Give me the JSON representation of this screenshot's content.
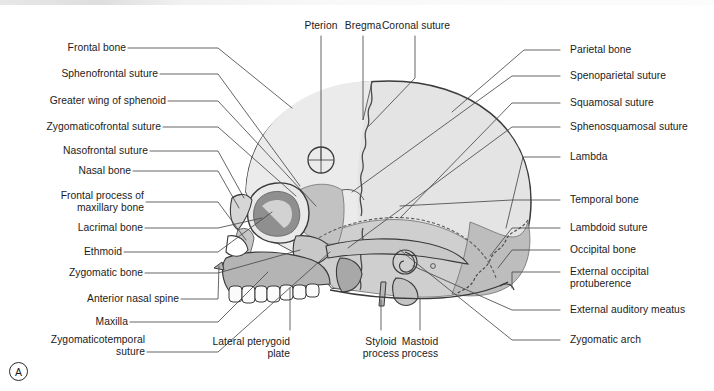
{
  "figure": {
    "panel_letter": "A"
  },
  "colors": {
    "background": "#ffffff",
    "outline": "#3a3a3a",
    "leader_line": "#4a4a4a",
    "text": "#1b1b1b",
    "frontal_bone": "#ebebeb",
    "parietal_bone": "#e4e4e4",
    "temporal_bone": "#cfcfcf",
    "occipital_bone": "#bdbdbd",
    "sphenoid": "#c2c2c2",
    "maxilla": "#b4b4b4",
    "zygomatic_bone": "#c8c8c8",
    "nasal_bone": "#d6d6d6",
    "orbit_shadow": "#8f8f8f",
    "teeth": "#fbfbfb"
  },
  "labels": {
    "top": [
      {
        "id": "pterion",
        "text": "Pterion"
      },
      {
        "id": "bregma",
        "text": "Bregma"
      },
      {
        "id": "coronal-suture",
        "text": "Coronal suture"
      }
    ],
    "left": [
      {
        "id": "frontal-bone",
        "text": "Frontal bone"
      },
      {
        "id": "sphenofrontal-suture",
        "text": "Sphenofrontal suture"
      },
      {
        "id": "greater-wing-of-sphenoid",
        "text": "Greater wing of sphenoid"
      },
      {
        "id": "zygomaticofrontal-suture",
        "text": "Zygomaticofrontal suture"
      },
      {
        "id": "nasofrontal-suture",
        "text": "Nasofrontal suture"
      },
      {
        "id": "nasal-bone",
        "text": "Nasal bone"
      },
      {
        "id": "frontal-process-of-maxillary-bone",
        "text": "Frontal process of\nmaxillary bone"
      },
      {
        "id": "lacrimal-bone",
        "text": "Lacrimal bone"
      },
      {
        "id": "ethmoid",
        "text": "Ethmoid"
      },
      {
        "id": "zygomatic-bone",
        "text": "Zygomatic bone"
      },
      {
        "id": "anterior-nasal-spine",
        "text": "Anterior nasal spine"
      },
      {
        "id": "maxilla",
        "text": "Maxilla"
      },
      {
        "id": "zygomaticotemporal-suture",
        "text": "Zygomaticotemporal\nsuture"
      }
    ],
    "right": [
      {
        "id": "parietal-bone",
        "text": "Parietal bone"
      },
      {
        "id": "spenoparietal-suture",
        "text": "Spenoparietal suture"
      },
      {
        "id": "squamosal-suture",
        "text": "Squamosal suture"
      },
      {
        "id": "sphenosquamosal-suture",
        "text": "Sphenosquamosal suture"
      },
      {
        "id": "lambda",
        "text": "Lambda"
      },
      {
        "id": "temporal-bone",
        "text": "Temporal bone"
      },
      {
        "id": "lambdoid-suture",
        "text": "Lambdoid suture"
      },
      {
        "id": "occipital-bone",
        "text": "Occipital bone"
      },
      {
        "id": "external-occipital-protuberence",
        "text": "External occipital\nprotuberence"
      },
      {
        "id": "external-auditory-meatus",
        "text": "External auditory meatus"
      },
      {
        "id": "zygomatic-arch",
        "text": "Zygomatic arch"
      }
    ],
    "bottom": [
      {
        "id": "lateral-pterygoid-plate",
        "text": "Lateral pterygoid\nplate"
      },
      {
        "id": "styloid-process",
        "text": "Styloid\nprocess"
      },
      {
        "id": "mastoid-process",
        "text": "Mastoid\nprocess"
      }
    ]
  }
}
